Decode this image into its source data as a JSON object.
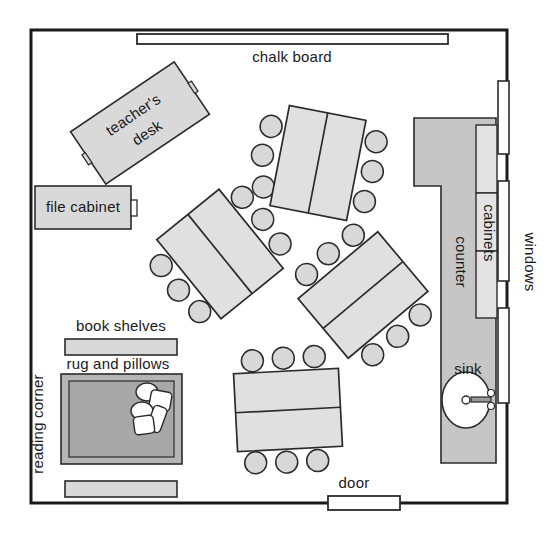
{
  "plan": {
    "title": "classroom floor plan",
    "canvas": {
      "width": 558,
      "height": 533
    },
    "room": {
      "name": "classroom",
      "x": 31,
      "y": 30,
      "width": 476,
      "height": 473,
      "wall_color": "#1a1a1a",
      "wall_thickness": 3,
      "fill": "#ffffff"
    },
    "colors": {
      "furniture_fill": "#d9d9d9",
      "furniture_light_fill": "#e3e3e3",
      "table_fill": "#e0e0e0",
      "chair_fill": "#d8d8d8",
      "counter_fill": "#c6c6c6",
      "rug_outer_fill": "#b5b5b5",
      "rug_inner_fill": "#a8a8a8",
      "pillow_fill": "#ffffff",
      "outline": "#2b2b2b",
      "opening_fill": "#ffffff",
      "text": "#1a1a1a"
    }
  },
  "labels": {
    "chalk_board": "chalk board",
    "teachers_desk": "teacher's desk",
    "teachers_desk_line1": "teacher's",
    "teachers_desk_line2": "desk",
    "file_cabinet": "file cabinet",
    "book_shelves": "book shelves",
    "rug_and_pillows": "rug and pillows",
    "reading_corner": "reading corner",
    "door": "door",
    "windows": "windows",
    "counter": "counter",
    "cabinets": "cabinets",
    "sink": "sink"
  },
  "fixtures": {
    "chalk_board": {
      "label": "chalk board",
      "x": 137,
      "y": 34,
      "width": 311,
      "height": 10,
      "fill": "#ffffff",
      "label_x": 292,
      "label_y": 62
    },
    "door": {
      "label": "door",
      "x": 328,
      "y": 496,
      "width": 72,
      "height": 14,
      "fill": "#ffffff",
      "label_x": 354,
      "label_y": 488
    },
    "windows": {
      "label": "windows",
      "label_x": 525,
      "label_y": 262,
      "segments": [
        {
          "x": 498,
          "y": 81,
          "width": 11,
          "height": 73
        },
        {
          "x": 498,
          "y": 181,
          "width": 11,
          "height": 100
        },
        {
          "x": 498,
          "y": 308,
          "width": 11,
          "height": 95
        }
      ],
      "fill": "#ffffff"
    }
  },
  "furniture": {
    "teachers_desk": {
      "label": "teacher's desk",
      "cx": 140,
      "cy": 123,
      "width": 125,
      "height": 63,
      "rotation": -34,
      "fill": "#d9d9d9",
      "label_rotation": -34,
      "knob_left": {
        "x": -66,
        "y": -6,
        "width": 4,
        "height": 12
      },
      "knob_right": {
        "x": 62,
        "y": -6,
        "width": 4,
        "height": 12
      }
    },
    "file_cabinet": {
      "label": "file cabinet",
      "x": 35,
      "y": 186,
      "width": 96,
      "height": 43,
      "fill": "#d9d9d9",
      "handle": {
        "x": 131,
        "y": 200,
        "width": 6,
        "height": 16
      },
      "label_x": 83,
      "label_y": 212
    },
    "book_shelves": {
      "label": "book shelves",
      "x": 65,
      "y": 339,
      "width": 112,
      "height": 16,
      "fill": "#d9d9d9",
      "label_x": 121,
      "label_y": 331
    },
    "lower_shelf": {
      "label": "shelf",
      "x": 65,
      "y": 481,
      "width": 112,
      "height": 16,
      "fill": "#d9d9d9"
    },
    "rug": {
      "label": "rug and pillows",
      "outer": {
        "x": 61,
        "y": 374,
        "width": 121,
        "height": 90,
        "fill": "#b5b5b5"
      },
      "inner": {
        "x": 69,
        "y": 381,
        "width": 105,
        "height": 76,
        "fill": "#a8a8a8"
      },
      "label_x": 118,
      "label_y": 369,
      "pillows": [
        {
          "type": "ellipse",
          "cx": 147,
          "cy": 392,
          "rx": 11,
          "ry": 9,
          "rotation": 0
        },
        {
          "type": "rect",
          "x": 150,
          "y": 391,
          "width": 21,
          "height": 19,
          "rotation": 10
        },
        {
          "type": "ellipse",
          "cx": 142,
          "cy": 411,
          "rx": 11,
          "ry": 9,
          "rotation": 0
        },
        {
          "type": "rect",
          "x": 150,
          "y": 406,
          "width": 14,
          "height": 26,
          "rotation": 20
        },
        {
          "type": "rect",
          "x": 134,
          "y": 416,
          "width": 20,
          "height": 18,
          "rotation": -8
        }
      ]
    },
    "reading_corner": {
      "label": "reading corner",
      "label_x": 43,
      "label_y": 424
    }
  },
  "counter_area": {
    "counter": {
      "label": "counter",
      "label_x": 456,
      "label_y": 262,
      "fill": "#c6c6c6",
      "points": "414,118 496,118 496,463 441,463 441,186 414,186"
    },
    "cabinets": {
      "label": "cabinets",
      "label_x": 484,
      "label_y": 233,
      "fill": "#e3e3e3",
      "sections": [
        {
          "x": 476,
          "y": 125,
          "width": 21,
          "height": 68
        },
        {
          "x": 476,
          "y": 193,
          "width": 21,
          "height": 58
        },
        {
          "x": 476,
          "y": 251,
          "width": 21,
          "height": 67
        }
      ]
    },
    "sink": {
      "label": "sink",
      "label_x": 468,
      "label_y": 374,
      "basin": {
        "cx": 466,
        "cy": 400,
        "rx": 24,
        "ry": 28,
        "fill": "#ffffff"
      },
      "drain": {
        "cx": 466,
        "cy": 400,
        "r": 4
      },
      "faucet_spout": {
        "x": 471,
        "y": 397,
        "width": 20,
        "height": 5
      },
      "faucet_handle_top": {
        "cx": 491,
        "cy": 393,
        "r": 3.5
      },
      "faucet_handle_bottom": {
        "cx": 491,
        "cy": 406,
        "r": 3.5
      }
    }
  },
  "tables": [
    {
      "name": "table-top-center",
      "cx": 318,
      "cy": 163,
      "width": 78,
      "height": 102,
      "rotation": 11,
      "divider": "vertical",
      "fill": "#e0e0e0",
      "chairs": [
        {
          "x": -53,
          "y": -27
        },
        {
          "x": -56,
          "y": 3
        },
        {
          "x": -49,
          "y": 34
        },
        {
          "x": 53,
          "y": -32
        },
        {
          "x": 55,
          "y": -2
        },
        {
          "x": 53,
          "y": 29
        }
      ]
    },
    {
      "name": "table-mid-left",
      "cx": 220,
      "cy": 254,
      "width": 80,
      "height": 102,
      "rotation": -39,
      "divider": "vertical",
      "fill": "#e0e0e0",
      "chairs": [
        {
          "x": -53,
          "y": -28
        },
        {
          "x": -55,
          "y": 2
        },
        {
          "x": -52,
          "y": 32
        },
        {
          "x": 53,
          "y": -30
        },
        {
          "x": 55,
          "y": 0
        },
        {
          "x": 53,
          "y": 30
        }
      ]
    },
    {
      "name": "table-mid-right",
      "cx": 363,
      "cy": 295,
      "width": 104,
      "height": 78,
      "rotation": -40,
      "divider": "horizontal",
      "fill": "#e0e0e0",
      "chairs": [
        {
          "x": -30,
          "y": -52
        },
        {
          "x": 0,
          "y": -54
        },
        {
          "x": 31,
          "y": -52
        },
        {
          "x": -31,
          "y": 52
        },
        {
          "x": 0,
          "y": 54
        },
        {
          "x": 31,
          "y": 52
        }
      ]
    },
    {
      "name": "table-bottom-center",
      "cx": 288,
      "cy": 410,
      "width": 105,
      "height": 78,
      "rotation": -3,
      "divider": "horizontal",
      "fill": "#e0e0e0",
      "chairs": [
        {
          "x": -33,
          "y": -51
        },
        {
          "x": -2,
          "y": -52
        },
        {
          "x": 29,
          "y": -52
        },
        {
          "x": -35,
          "y": 51
        },
        {
          "x": -4,
          "y": 52
        },
        {
          "x": 27,
          "y": 52
        }
      ]
    }
  ],
  "chair_radius": 11
}
